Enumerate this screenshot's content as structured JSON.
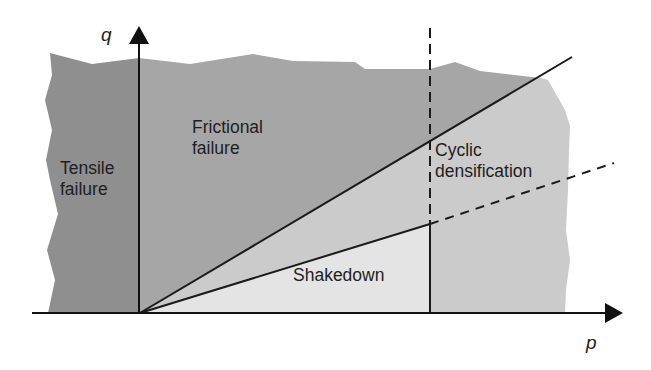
{
  "diagram": {
    "type": "stress-space regime diagram",
    "axes": {
      "x_label": "p",
      "y_label": "q"
    },
    "regions": [
      {
        "id": "tensile",
        "label_lines": [
          "Tensile",
          "failure"
        ],
        "fill": "#8f8f8f"
      },
      {
        "id": "frictional",
        "label_lines": [
          "Frictional",
          "failure"
        ],
        "fill": "#a6a6a6"
      },
      {
        "id": "cyclic",
        "label_lines": [
          "Cyclic",
          "densification"
        ],
        "fill": "#cbcbcb"
      },
      {
        "id": "shakedown",
        "label_lines": [
          "Shakedown"
        ],
        "fill": "#e4e4e4"
      }
    ],
    "lines": [
      {
        "id": "failure-line",
        "style": "solid"
      },
      {
        "id": "shakedown-limit-line",
        "style": "solid then dashed"
      },
      {
        "id": "vertical-limit-line",
        "style": "dashed above, solid below"
      }
    ],
    "colors": {
      "line": "#1a1a1a",
      "background": "#ffffff"
    }
  }
}
